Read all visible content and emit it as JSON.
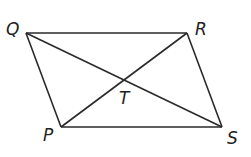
{
  "diagram": {
    "type": "parallelogram-with-diagonals",
    "stroke_color": "#2a2a2a",
    "vertices": {
      "Q": {
        "label": "Q",
        "x": 26,
        "y": 33
      },
      "R": {
        "label": "R",
        "x": 187,
        "y": 33
      },
      "S": {
        "label": "S",
        "x": 222,
        "y": 127
      },
      "P": {
        "label": "P",
        "x": 61,
        "y": 127
      }
    },
    "intersection": {
      "label": "T",
      "x": 125,
      "y": 80
    },
    "labels": {
      "Q": "Q",
      "R": "R",
      "S": "S",
      "P": "P",
      "T": "T"
    }
  }
}
